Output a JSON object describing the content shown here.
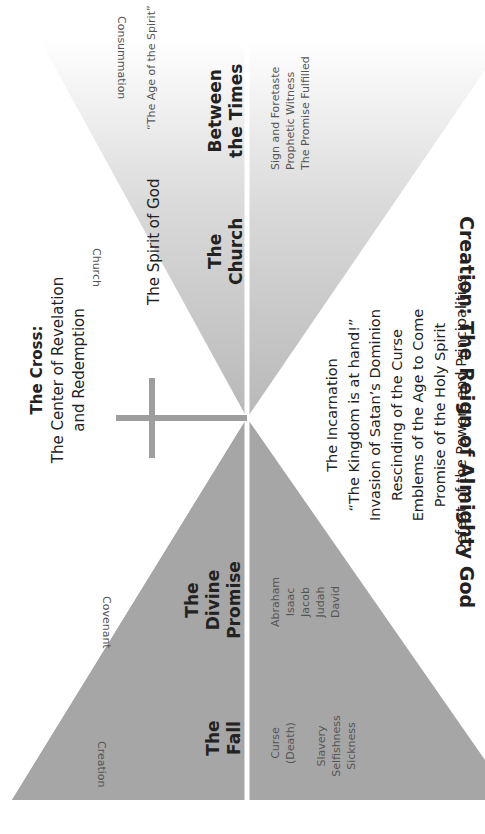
{
  "title": "Creation: The Reign of Almighty God",
  "colors": {
    "bottom_trapezoid": "#a6a6a6",
    "top_triangle_base": "#bdbdbd",
    "top_triangle_fade": "#ffffff",
    "cross": "#9e9e9e",
    "divider": "#ffffff",
    "text": "#222222"
  },
  "timeline_labels": {
    "creation": "Creation",
    "covenant": "Covenant",
    "church": "Church",
    "consummation": "Consummation"
  },
  "sections": {
    "fall": {
      "heading_line1": "The",
      "heading_line2": "Fall",
      "items": [
        "Curse",
        "(Death)",
        "Slavery",
        "Selfishness",
        "Sickness"
      ]
    },
    "divine_promise": {
      "heading_line1": "The",
      "heading_line2": "Divine",
      "heading_line3": "Promise",
      "items": [
        "Abraham",
        "Isaac",
        "Jacob",
        "Judah",
        "David"
      ]
    },
    "cross": {
      "heading": "The Cross:",
      "subtitle_line1": "The Center of Revelation",
      "subtitle_line2": "and Redemption",
      "items": [
        "The Incarnation",
        "“The Kingdom is at hand!”",
        "Invasion of Satan’s Dominion",
        "Rescinding of the Curse",
        "Emblems of the Age to Come",
        "Promise of the Holy Spirit",
        "Defeat of the Powers and Principalities"
      ]
    },
    "church": {
      "heading_line1": "The",
      "heading_line2": "Church",
      "spirit_label": "The Spirit of God"
    },
    "between_times": {
      "heading_line1": "Between",
      "heading_line2": "the Times",
      "age_label": "“The Age of the Spirit”",
      "items": [
        "Sign and Foretaste",
        "Prophetic Witness",
        "The Promise Fulfilled"
      ]
    }
  }
}
